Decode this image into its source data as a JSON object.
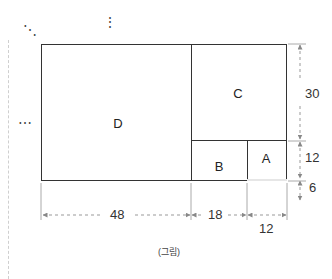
{
  "figure": {
    "regions": [
      {
        "id": "D",
        "label": "D"
      },
      {
        "id": "C",
        "label": "C"
      },
      {
        "id": "B",
        "label": "B"
      },
      {
        "id": "A",
        "label": "A"
      },
      {
        "id": "shaded",
        "label": ""
      }
    ],
    "dimensions": {
      "bottom_left": "48",
      "bottom_middle": "18",
      "bottom_right": "12",
      "right_top": "30",
      "right_middle": "12",
      "right_bottom": "6"
    },
    "caption": "(그림)",
    "continuation_marks": {
      "top_left": "⋱",
      "top_middle": "⋮",
      "left": "⋯"
    },
    "colors": {
      "line": "#333333",
      "dashed": "#999999",
      "shaded_fill": "#e6e6e6"
    }
  }
}
